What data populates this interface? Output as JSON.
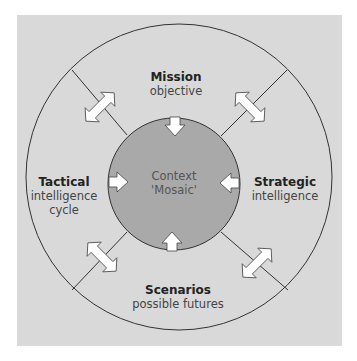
{
  "colors": {
    "panel_bg": "#d9d9d9",
    "outer_fill": "#d9d9d9",
    "inner_fill": "#a9a9a9",
    "line": "#333333",
    "arrow_fill": "#ffffff",
    "arrow_stroke": "#444444"
  },
  "center": {
    "line1": "Context",
    "line2": "'Mosaic'"
  },
  "segments": {
    "top": {
      "title": "Mission",
      "subtitle": "objective"
    },
    "right": {
      "title": "Strategic",
      "subtitle": "intelligence"
    },
    "bottom": {
      "title": "Scenarios",
      "subtitle": "possible futures"
    },
    "left": {
      "title": "Tactical",
      "subtitle_1": "intelligence",
      "subtitle_2": "cycle"
    }
  },
  "arrows": {
    "inward": [
      "top",
      "right",
      "bottom",
      "left"
    ],
    "bidirectional": [
      "top-left",
      "top-right",
      "bottom-left",
      "bottom-right"
    ]
  }
}
